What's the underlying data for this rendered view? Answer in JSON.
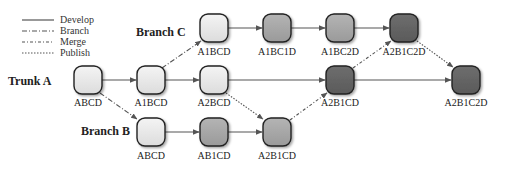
{
  "legend": {
    "items": [
      {
        "key": "develop",
        "label": "Develop",
        "dash": ""
      },
      {
        "key": "branch",
        "label": "Branch",
        "dash": "5,2,1,2"
      },
      {
        "key": "merge",
        "label": "Merge",
        "dash": "3,2,1,2"
      },
      {
        "key": "publish",
        "label": "Publish",
        "dash": "1.5,1.5"
      }
    ]
  },
  "lanes": {
    "branch_c": "Branch C",
    "trunk_a": "Trunk A",
    "branch_b": "Branch B"
  },
  "colors": {
    "light": "#e6e6e6",
    "medium": "#a8a8a8",
    "dark": "#666666",
    "edge": "#555555",
    "outline": "#222222"
  },
  "nodes": {
    "c1": {
      "label": "A1BCD",
      "shade": "light"
    },
    "c2": {
      "label": "A1BC1D",
      "shade": "medium"
    },
    "c3": {
      "label": "A1BC2D",
      "shade": "medium"
    },
    "c4": {
      "label": "A2B1C2D",
      "shade": "dark"
    },
    "a1": {
      "label": "ABCD",
      "shade": "light"
    },
    "a2": {
      "label": "A1BCD",
      "shade": "light"
    },
    "a3": {
      "label": "A2BCD",
      "shade": "light"
    },
    "a4": {
      "label": "A2B1CD",
      "shade": "dark"
    },
    "a5": {
      "label": "A2B1C2D",
      "shade": "dark"
    },
    "b1": {
      "label": "ABCD",
      "shade": "light"
    },
    "b2": {
      "label": "AB1CD",
      "shade": "medium"
    },
    "b3": {
      "label": "A2B1CD",
      "shade": "medium"
    }
  },
  "edges": [
    {
      "from": "a1",
      "to": "a2",
      "type": "develop"
    },
    {
      "from": "a2",
      "to": "a3",
      "type": "develop"
    },
    {
      "from": "a3",
      "to": "a4",
      "type": "develop"
    },
    {
      "from": "a4",
      "to": "a5",
      "type": "develop"
    },
    {
      "from": "c1",
      "to": "c2",
      "type": "develop"
    },
    {
      "from": "c2",
      "to": "c3",
      "type": "develop"
    },
    {
      "from": "c3",
      "to": "c4",
      "type": "develop"
    },
    {
      "from": "b1",
      "to": "b2",
      "type": "develop"
    },
    {
      "from": "b2",
      "to": "b3",
      "type": "develop"
    },
    {
      "from": "a1",
      "to": "b1",
      "type": "branch"
    },
    {
      "from": "a2",
      "to": "c1",
      "type": "branch"
    },
    {
      "from": "a3",
      "to": "b3",
      "type": "publish"
    },
    {
      "from": "b3",
      "to": "a4",
      "type": "merge"
    },
    {
      "from": "a4",
      "to": "c4",
      "type": "merge"
    },
    {
      "from": "c4",
      "to": "a5",
      "type": "publish"
    }
  ]
}
